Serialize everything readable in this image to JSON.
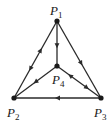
{
  "diagram": {
    "type": "directed-graph",
    "nodes": [
      {
        "id": "P1",
        "letter": "P",
        "sub": "1",
        "x": 57,
        "y": 21,
        "lx": 50,
        "ly": 15
      },
      {
        "id": "P2",
        "letter": "P",
        "sub": "2",
        "x": 14,
        "y": 98,
        "lx": 7,
        "ly": 117
      },
      {
        "id": "P3",
        "letter": "P",
        "sub": "3",
        "x": 101,
        "y": 98,
        "lx": 94,
        "ly": 117
      },
      {
        "id": "P4",
        "letter": "P",
        "sub": "4",
        "x": 57,
        "y": 66,
        "lx": 52,
        "ly": 84
      }
    ],
    "edges": [
      {
        "from": "P1",
        "to": "P2",
        "arrows": [
          {
            "t": 0.38,
            "dir": "to-from"
          },
          {
            "t": 0.62,
            "dir": "from-to"
          }
        ]
      },
      {
        "from": "P1",
        "to": "P3",
        "arrows": [
          {
            "t": 0.55,
            "dir": "from-to"
          }
        ]
      },
      {
        "from": "P1",
        "to": "P4",
        "arrows": [
          {
            "t": 0.55,
            "dir": "from-to"
          }
        ]
      },
      {
        "from": "P4",
        "to": "P2",
        "arrows": [
          {
            "t": 0.5,
            "dir": "from-to"
          }
        ]
      },
      {
        "from": "P4",
        "to": "P3",
        "arrows": [
          {
            "t": 0.3,
            "dir": "to-from"
          },
          {
            "t": 0.68,
            "dir": "from-to"
          }
        ]
      },
      {
        "from": "P3",
        "to": "P2",
        "arrows": [
          {
            "t": 0.5,
            "dir": "from-to"
          }
        ]
      }
    ],
    "colors": {
      "ink": "#1a1a1a",
      "background": "#ffffff"
    }
  }
}
